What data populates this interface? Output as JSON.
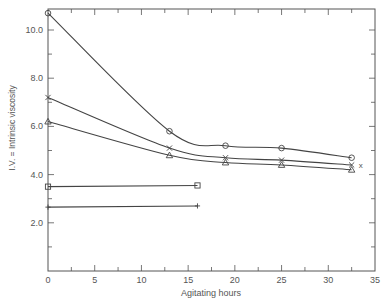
{
  "chart_data": {
    "type": "line",
    "title": "",
    "xlabel": "Agitating hours",
    "ylabel": "I.V. = Intrinsic   viscosity",
    "xlim": [
      0,
      35
    ],
    "ylim": [
      0,
      11
    ],
    "x_ticks": [
      0,
      5,
      10,
      15,
      20,
      25,
      30,
      35
    ],
    "y_ticks": [
      2.0,
      4.0,
      6.0,
      8.0,
      10.0
    ],
    "x_tick_labels": [
      "0",
      "5",
      "10",
      "15",
      "20",
      "25",
      "30",
      "35"
    ],
    "y_tick_labels": [
      "2.0",
      "4.0",
      "6.0",
      "8.0",
      "10.0"
    ],
    "grid": false,
    "legend": null,
    "series": [
      {
        "name": "circle",
        "marker": "o",
        "x": [
          0,
          13,
          19,
          25,
          32.5
        ],
        "y": [
          10.7,
          5.8,
          5.2,
          5.1,
          4.7
        ],
        "curve": true
      },
      {
        "name": "cross",
        "marker": "x",
        "x": [
          0,
          13,
          19,
          25,
          32.5
        ],
        "y": [
          7.2,
          5.1,
          4.7,
          4.6,
          4.4
        ],
        "curve": true
      },
      {
        "name": "triangle",
        "marker": "^",
        "x": [
          0,
          13,
          19,
          25,
          32.5
        ],
        "y": [
          6.2,
          4.8,
          4.5,
          4.4,
          4.2
        ],
        "curve": true
      },
      {
        "name": "square",
        "marker": "s",
        "x": [
          0,
          16
        ],
        "y": [
          3.5,
          3.55
        ],
        "curve": false
      },
      {
        "name": "plus",
        "marker": "+",
        "x": [
          0,
          16
        ],
        "y": [
          2.65,
          2.7
        ],
        "curve": false
      }
    ]
  },
  "labels": {
    "xlabel": "Agitating hours",
    "ylabel": "I.V. = Intrinsic   viscosity"
  }
}
